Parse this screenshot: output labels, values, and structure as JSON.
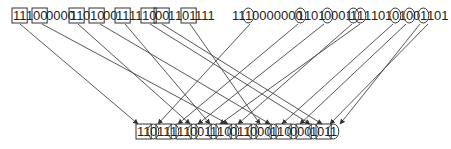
{
  "top_left": {
    "text": "1110000000110100011111000110 1111",
    "segments": [
      {
        "x": 13,
        "text": "11",
        "shape": "box"
      },
      {
        "x": 26,
        "text": "1",
        "shape": "none"
      },
      {
        "x": 33,
        "text": "00",
        "shape": "box"
      },
      {
        "x": 46,
        "text": "0000",
        "shape": "none"
      },
      {
        "x": 70,
        "text": "11",
        "shape": "box"
      },
      {
        "x": 83,
        "text": "0",
        "shape": "none"
      },
      {
        "x": 90,
        "text": "10",
        "shape": "box"
      },
      {
        "x": 103,
        "text": "00",
        "shape": "none"
      },
      {
        "x": 116,
        "text": "11",
        "shape": "box"
      },
      {
        "x": 129,
        "text": "11",
        "shape": "none"
      },
      {
        "x": 142,
        "text": "10",
        "shape": "box"
      },
      {
        "x": 155,
        "text": "00",
        "shape": "box"
      },
      {
        "x": 168,
        "text": "1",
        "shape": "none"
      },
      {
        "x": 175,
        "text": "1",
        "shape": "none"
      },
      {
        "x": 182,
        "text": "01",
        "shape": "box"
      },
      {
        "x": 195,
        "text": "111",
        "shape": "none"
      }
    ]
  },
  "top_right": {
    "text": "11100000000110100011111101010011 01",
    "segments": [
      {
        "x": 232,
        "text": "11",
        "shape": "none"
      },
      {
        "x": 245,
        "text": "1",
        "shape": "circle"
      },
      {
        "x": 252,
        "text": "0000000",
        "shape": "none"
      },
      {
        "x": 297,
        "text": "1",
        "shape": "circle"
      },
      {
        "x": 304,
        "text": "1",
        "shape": "none"
      },
      {
        "x": 311,
        "text": "01",
        "shape": "none"
      },
      {
        "x": 324,
        "text": "0",
        "shape": "circle"
      },
      {
        "x": 331,
        "text": "001",
        "shape": "none"
      },
      {
        "x": 350,
        "text": "1",
        "shape": "circle"
      },
      {
        "x": 357,
        "text": "1",
        "shape": "circle"
      },
      {
        "x": 364,
        "text": "1",
        "shape": "none"
      },
      {
        "x": 371,
        "text": "1",
        "shape": "none"
      },
      {
        "x": 378,
        "text": "0",
        "shape": "none"
      },
      {
        "x": 385,
        "text": "1",
        "shape": "none"
      },
      {
        "x": 392,
        "text": "0",
        "shape": "circle"
      },
      {
        "x": 399,
        "text": "1",
        "shape": "none"
      },
      {
        "x": 406,
        "text": "0",
        "shape": "circle"
      },
      {
        "x": 413,
        "text": "0",
        "shape": "none"
      },
      {
        "x": 420,
        "text": "1",
        "shape": "circle"
      },
      {
        "x": 427,
        "text": "1",
        "shape": "none"
      },
      {
        "x": 434,
        "text": "01",
        "shape": "none"
      }
    ]
  },
  "bottom": {
    "text": "110111110010110011000110000111",
    "segments": [
      {
        "x": 137,
        "text": "11",
        "shape": "box"
      },
      {
        "x": 150,
        "text": "0",
        "shape": "circle"
      },
      {
        "x": 157,
        "text": "11",
        "shape": "box"
      },
      {
        "x": 170,
        "text": "1",
        "shape": "circle"
      },
      {
        "x": 177,
        "text": "11",
        "shape": "box"
      },
      {
        "x": 190,
        "text": "0",
        "shape": "circle"
      },
      {
        "x": 197,
        "text": "01",
        "shape": "box"
      },
      {
        "x": 210,
        "text": "1",
        "shape": "circle"
      },
      {
        "x": 217,
        "text": "10",
        "shape": "box"
      },
      {
        "x": 230,
        "text": "0",
        "shape": "circle"
      },
      {
        "x": 237,
        "text": "11",
        "shape": "box"
      },
      {
        "x": 250,
        "text": "0",
        "shape": "circle"
      },
      {
        "x": 257,
        "text": "00",
        "shape": "box"
      },
      {
        "x": 270,
        "text": "1",
        "shape": "circle"
      },
      {
        "x": 277,
        "text": "10",
        "shape": "box"
      },
      {
        "x": 290,
        "text": "0",
        "shape": "circle"
      },
      {
        "x": 297,
        "text": "00",
        "shape": "box"
      },
      {
        "x": 310,
        "text": "1",
        "shape": "circle"
      },
      {
        "x": 317,
        "text": "01",
        "shape": "box"
      },
      {
        "x": 330,
        "text": "1",
        "shape": "circle"
      }
    ]
  },
  "arrows": [
    {
      "x1": 20,
      "y1": 24,
      "x2": 138,
      "y2": 124
    },
    {
      "x1": 42,
      "y1": 24,
      "x2": 228,
      "y2": 124
    },
    {
      "x1": 78,
      "y1": 24,
      "x2": 190,
      "y2": 124
    },
    {
      "x1": 100,
      "y1": 24,
      "x2": 270,
      "y2": 124
    },
    {
      "x1": 125,
      "y1": 24,
      "x2": 210,
      "y2": 124
    },
    {
      "x1": 150,
      "y1": 24,
      "x2": 310,
      "y2": 124
    },
    {
      "x1": 162,
      "y1": 24,
      "x2": 322,
      "y2": 124
    },
    {
      "x1": 190,
      "y1": 24,
      "x2": 260,
      "y2": 124
    },
    {
      "x1": 250,
      "y1": 24,
      "x2": 158,
      "y2": 124
    },
    {
      "x1": 298,
      "y1": 24,
      "x2": 178,
      "y2": 124
    },
    {
      "x1": 324,
      "y1": 24,
      "x2": 198,
      "y2": 124
    },
    {
      "x1": 352,
      "y1": 24,
      "x2": 238,
      "y2": 124
    },
    {
      "x1": 360,
      "y1": 24,
      "x2": 220,
      "y2": 124
    },
    {
      "x1": 393,
      "y1": 24,
      "x2": 282,
      "y2": 124
    },
    {
      "x1": 406,
      "y1": 24,
      "x2": 300,
      "y2": 124
    },
    {
      "x1": 420,
      "y1": 24,
      "x2": 340,
      "y2": 124
    },
    {
      "x1": 428,
      "y1": 24,
      "x2": 330,
      "y2": 124
    }
  ],
  "colors": {
    "line": "#444444",
    "text": "#222222"
  }
}
